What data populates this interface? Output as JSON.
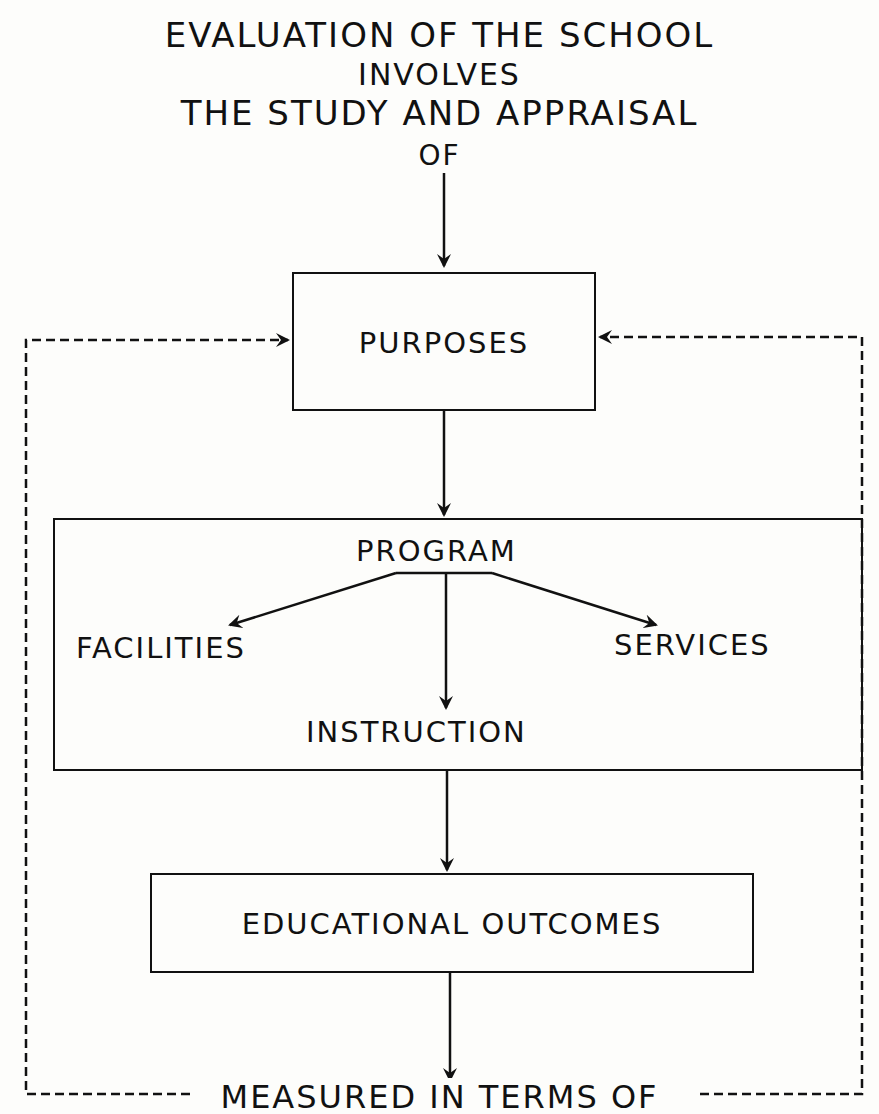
{
  "header": {
    "line1": "EVALUATION OF THE SCHOOL",
    "line2": "INVOLVES",
    "line3": "THE STUDY AND APPRAISAL",
    "line4": "OF"
  },
  "nodes": {
    "purposes": "PURPOSES",
    "program": "PROGRAM",
    "facilities": "FACILITIES",
    "services": "SERVICES",
    "instruction": "INSTRUCTION",
    "outcomes": "EDUCATIONAL OUTCOMES"
  },
  "footer": {
    "measured": "MEASURED IN TERMS OF"
  },
  "style": {
    "ink": "#111111",
    "paper": "#fdfdfb"
  }
}
